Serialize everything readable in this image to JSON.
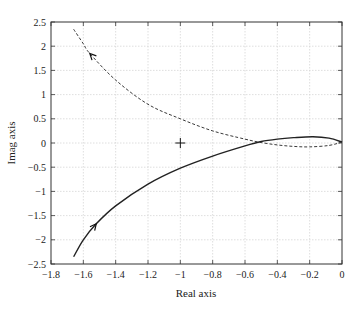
{
  "chart_data": {
    "type": "line",
    "title": "",
    "xlabel": "Real axis",
    "ylabel": "Imag axis",
    "xlim": [
      -1.8,
      0
    ],
    "ylim": [
      -2.5,
      2.5
    ],
    "grid": true,
    "x_ticks": [
      "−1.8",
      "−1.6",
      "−1.4",
      "−1.2",
      "−1",
      "−0.8",
      "−0.6",
      "−0.4",
      "−0.2",
      "0"
    ],
    "y_ticks": [
      "2.5",
      "2",
      "1.5",
      "1",
      "0.5",
      "0",
      "−0.5",
      "−1",
      "−1.5",
      "−2",
      "−2.5"
    ],
    "series": [
      {
        "name": "solid-locus",
        "style": "solid",
        "color": "#222222",
        "points": [
          [
            -1.66,
            -2.35
          ],
          [
            -1.6,
            -2.0
          ],
          [
            -1.52,
            -1.67
          ],
          [
            -1.4,
            -1.3
          ],
          [
            -1.2,
            -0.85
          ],
          [
            -1.0,
            -0.52
          ],
          [
            -0.8,
            -0.27
          ],
          [
            -0.6,
            -0.06
          ],
          [
            -0.5,
            0.03
          ],
          [
            -0.4,
            0.08
          ],
          [
            -0.3,
            0.11
          ],
          [
            -0.18,
            0.13
          ],
          [
            -0.08,
            0.1
          ],
          [
            0,
            0.02
          ]
        ],
        "arrow_at": [
          -1.52,
          -1.67
        ]
      },
      {
        "name": "dashed-locus",
        "style": "dashed",
        "color": "#222222",
        "points": [
          [
            -1.66,
            2.35
          ],
          [
            -1.6,
            2.05
          ],
          [
            -1.56,
            1.85
          ],
          [
            -1.4,
            1.3
          ],
          [
            -1.2,
            0.8
          ],
          [
            -1.0,
            0.5
          ],
          [
            -0.8,
            0.25
          ],
          [
            -0.6,
            0.08
          ],
          [
            -0.5,
            0.01
          ],
          [
            -0.4,
            -0.04
          ],
          [
            -0.3,
            -0.07
          ],
          [
            -0.2,
            -0.08
          ],
          [
            -0.08,
            -0.05
          ],
          [
            0,
            0.02
          ]
        ],
        "arrow_at": [
          -1.56,
          1.85
        ]
      }
    ],
    "markers": [
      {
        "name": "critical-point",
        "symbol": "+",
        "x": -1,
        "y": 0
      }
    ]
  }
}
